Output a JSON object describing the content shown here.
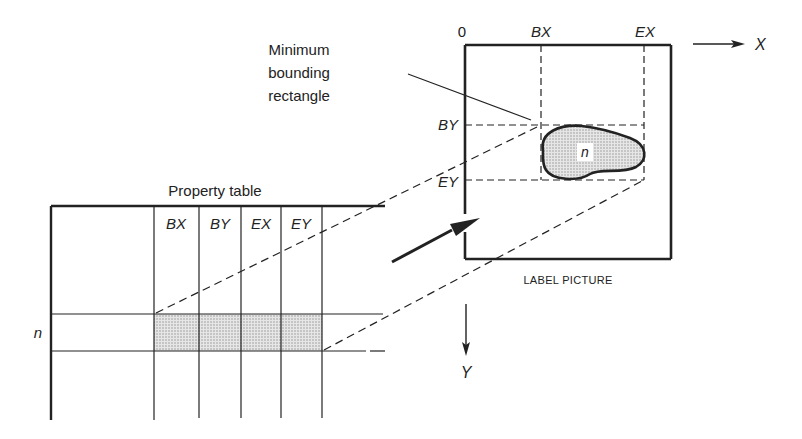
{
  "diagram": {
    "label_picture": {
      "caption": "LABEL PICTURE",
      "origin_label": "0",
      "x_axis_label": "X",
      "y_axis_label": "Y",
      "bx_label": "BX",
      "ex_label": "EX",
      "by_label": "BY",
      "ey_label": "EY",
      "region_label": "n"
    },
    "annotation": {
      "lines": [
        "Minimum",
        "bounding",
        "rectangle"
      ]
    },
    "property_table": {
      "title": "Property table",
      "columns": [
        "BX",
        "BY",
        "EX",
        "EY"
      ],
      "row_label": "n"
    },
    "colors": {
      "ink": "#222222",
      "shade": "#d8d8d8"
    }
  }
}
